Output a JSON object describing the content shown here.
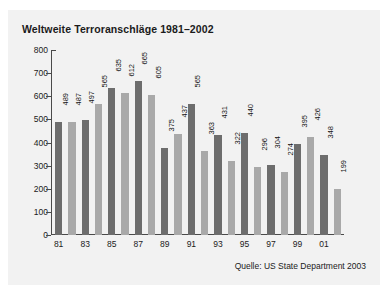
{
  "card": {
    "background": "#f2f2f2"
  },
  "chart_data": {
    "type": "bar",
    "title": "Weltweite Terroranschläge 1981–2002",
    "subtitle": "",
    "xlabel": "",
    "ylabel": "",
    "ylim": [
      0,
      800
    ],
    "ytick_step": 100,
    "ytick_labels": [
      "800",
      "700",
      "600",
      "500",
      "400",
      "300",
      "200",
      "100",
      "0"
    ],
    "ytick_values": [
      800,
      700,
      600,
      500,
      400,
      300,
      200,
      100,
      0
    ],
    "grid": false,
    "legend": "none",
    "categories": [
      "81",
      "82",
      "83",
      "84",
      "85",
      "86",
      "87",
      "88",
      "89",
      "90",
      "91",
      "92",
      "93",
      "94",
      "95",
      "96",
      "97",
      "98",
      "99",
      "00",
      "01",
      "02"
    ],
    "xtick_labels_shown": [
      "81",
      "83",
      "85",
      "87",
      "89",
      "91",
      "93",
      "95",
      "97",
      "99",
      "01"
    ],
    "values": [
      489,
      487,
      497,
      565,
      635,
      612,
      665,
      605,
      375,
      437,
      565,
      363,
      431,
      322,
      440,
      296,
      304,
      274,
      395,
      426,
      348,
      199
    ],
    "bar_colors": [
      "dark",
      "light",
      "dark",
      "light",
      "dark",
      "light",
      "dark",
      "light",
      "dark",
      "light",
      "dark",
      "light",
      "dark",
      "light",
      "dark",
      "light",
      "dark",
      "light",
      "dark",
      "light",
      "dark",
      "light"
    ],
    "annotation": "Quelle: US State Department 2003"
  },
  "colors": {
    "bar_dark": "#6d6d6d",
    "bar_light": "#a9a9a9",
    "axis": "#4a4a4a",
    "text": "#1b1b1b",
    "card_bg": "#f2f2f2",
    "page_bg": "#ffffff"
  }
}
